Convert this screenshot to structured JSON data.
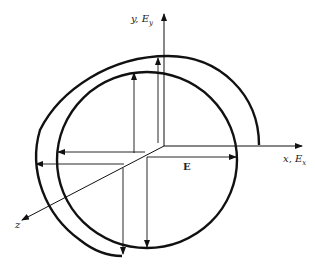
{
  "diagram": {
    "labels": {
      "y_axis": "y, E",
      "y_sub": "y",
      "x_axis": "x, E",
      "x_sub": "x",
      "z_axis": "z",
      "field": "E"
    },
    "colors": {
      "stroke": "#111111",
      "background": "#ffffff"
    }
  }
}
